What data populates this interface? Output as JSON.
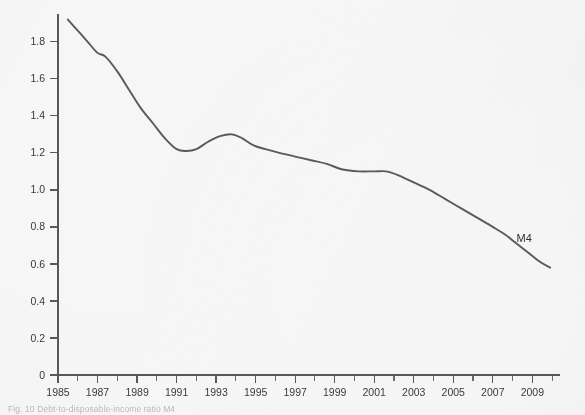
{
  "figure": {
    "background_color": "#f6f6f6",
    "caption": "Fig. 10 Debt-to-disposable-income ratio M4"
  },
  "chart_data": {
    "type": "line",
    "title": "",
    "xlabel": "",
    "ylabel": "",
    "xlim": [
      1985,
      2010.4
    ],
    "ylim": [
      0,
      1.95
    ],
    "grid": false,
    "legend_position": "inline-annotation",
    "line_color": "#5a5a5a",
    "axis_color": "#585858",
    "y_ticks": [
      0,
      0.2,
      0.4,
      0.6,
      0.8,
      1.0,
      1.2,
      1.4,
      1.6,
      1.8
    ],
    "y_tick_labels": [
      "0",
      "0.2",
      "0.4",
      "0.6",
      "0.8",
      "1.0",
      "1.2",
      "1.4",
      "1.6",
      "1.8"
    ],
    "x_ticks_major": [
      1985,
      1987,
      1989,
      1991,
      1993,
      1995,
      1997,
      1999,
      2001,
      2003,
      2005,
      2007,
      2009
    ],
    "x_tick_labels": [
      "1985",
      "1987",
      "1989",
      "1991",
      "1993",
      "1995",
      "1997",
      "1999",
      "2001",
      "2003",
      "2005",
      "2007",
      "2009"
    ],
    "x_ticks_minor": [
      1986,
      1988,
      1990,
      1992,
      1994,
      1996,
      1998,
      2000,
      2002,
      2004,
      2006,
      2008,
      2010
    ],
    "series": [
      {
        "name": "M4",
        "label": "M4",
        "label_x": 2008.2,
        "label_y": 0.72,
        "x": [
          1985.5,
          1986.0,
          1986.5,
          1987.0,
          1987.4,
          1988.0,
          1988.6,
          1989.2,
          1989.8,
          1990.4,
          1991.0,
          1991.5,
          1992.0,
          1992.6,
          1993.2,
          1993.8,
          1994.3,
          1994.9,
          1995.5,
          1996.2,
          1997.0,
          1997.8,
          1998.6,
          1999.4,
          2000.2,
          2001.0,
          2001.6,
          2002.2,
          2003.0,
          2003.8,
          2004.6,
          2005.4,
          2006.2,
          2007.0,
          2007.6,
          2008.2,
          2008.8,
          2009.4,
          2009.9
        ],
        "y": [
          1.92,
          1.86,
          1.8,
          1.74,
          1.72,
          1.64,
          1.54,
          1.44,
          1.36,
          1.28,
          1.22,
          1.21,
          1.22,
          1.26,
          1.29,
          1.3,
          1.28,
          1.24,
          1.22,
          1.2,
          1.18,
          1.16,
          1.14,
          1.11,
          1.1,
          1.1,
          1.1,
          1.08,
          1.04,
          1.0,
          0.95,
          0.9,
          0.85,
          0.8,
          0.76,
          0.71,
          0.66,
          0.61,
          0.58
        ]
      }
    ]
  }
}
